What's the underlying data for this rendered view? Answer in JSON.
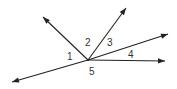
{
  "diagram": {
    "type": "angles-at-point",
    "line_color": "#222222",
    "label_color": "#333333",
    "rays": [
      {
        "id": "upper-left-ray"
      },
      {
        "id": "upper-right-ray"
      },
      {
        "id": "right-upper-ray"
      },
      {
        "id": "right-horizontal-ray"
      },
      {
        "id": "lower-left-ray"
      }
    ],
    "angle_labels": [
      "1",
      "2",
      "3",
      "4",
      "5"
    ]
  }
}
